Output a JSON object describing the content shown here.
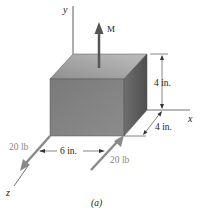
{
  "figure": {
    "caption": "(a)",
    "axes": {
      "x": "x",
      "y": "y",
      "z": "z"
    },
    "moment_label": "M",
    "dimensions": {
      "height": "4 in.",
      "depth": "4 in.",
      "width": "6 in."
    },
    "forces": [
      {
        "label": "20 lb",
        "position": "left"
      },
      {
        "label": "20 lb",
        "position": "right"
      }
    ],
    "colors": {
      "top_face": "#a9a9a9",
      "front_face": "#7d7d7d",
      "side_face": "#5f5f5f",
      "force_arrow": "#8a8a8a",
      "moment_arrow": "#555555",
      "line": "#333333"
    }
  }
}
